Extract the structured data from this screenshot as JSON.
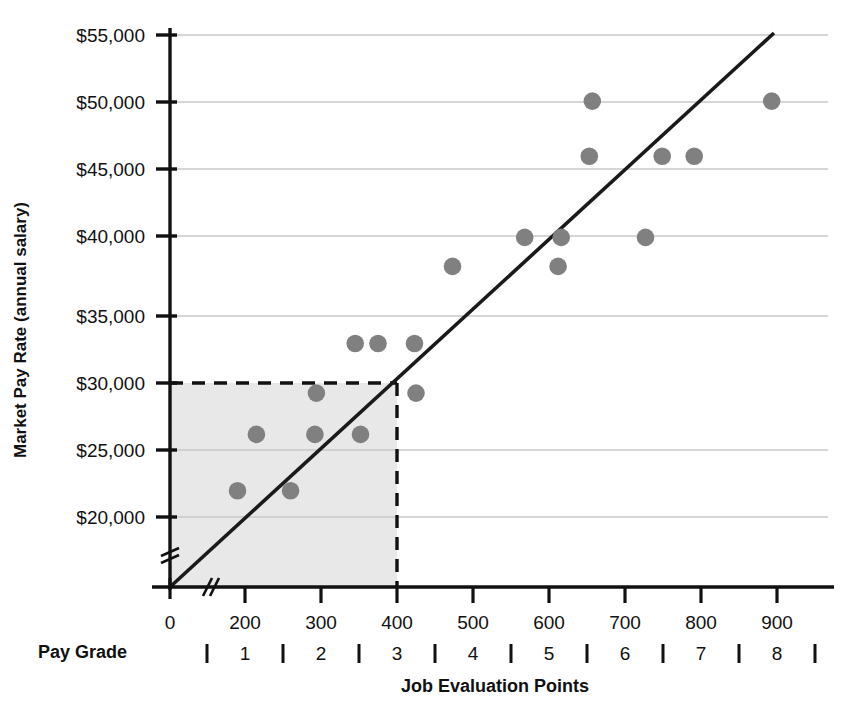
{
  "chart_data": {
    "type": "scatter",
    "title": "",
    "xlabel": "Job Evaluation Points",
    "ylabel": "Market Pay Rate (annual salary)",
    "secondary_axis_label": "Pay Grade",
    "xlim": [
      0,
      950
    ],
    "ylim": [
      17500,
      57500
    ],
    "x_ticks": [
      0,
      200,
      300,
      400,
      500,
      600,
      700,
      800,
      900
    ],
    "x_tick_labels": [
      "0",
      "200",
      "300",
      "400",
      "500",
      "600",
      "700",
      "800",
      "900"
    ],
    "y_ticks": [
      20000,
      25000,
      30000,
      35000,
      40000,
      45000,
      50000,
      55000
    ],
    "y_tick_labels": [
      "$20,000",
      "$25,000",
      "$30,000",
      "$35,000",
      "$40,000",
      "$45,000",
      "$50,000",
      "$55,000"
    ],
    "axis_break_x": true,
    "axis_break_y": true,
    "grid": "horizontal",
    "legend": "none",
    "point_color": "#808080",
    "line_color": "#1a1a1a",
    "shaded_region_color": "#e8e8e8",
    "pay_grades": [
      "1",
      "2",
      "3",
      "4",
      "5",
      "6",
      "7",
      "8"
    ],
    "pay_grade_boundaries": [
      150,
      250,
      350,
      450,
      550,
      650,
      750,
      850,
      950
    ],
    "points": [
      {
        "x": 180,
        "y": 21900
      },
      {
        "x": 260,
        "y": 21900
      },
      {
        "x": 215,
        "y": 26000
      },
      {
        "x": 292,
        "y": 26000
      },
      {
        "x": 352,
        "y": 26000
      },
      {
        "x": 294,
        "y": 29000
      },
      {
        "x": 425,
        "y": 29000
      },
      {
        "x": 345,
        "y": 32600
      },
      {
        "x": 375,
        "y": 32600
      },
      {
        "x": 423,
        "y": 32600
      },
      {
        "x": 473,
        "y": 38200
      },
      {
        "x": 612,
        "y": 38200
      },
      {
        "x": 568,
        "y": 40300
      },
      {
        "x": 616,
        "y": 40300
      },
      {
        "x": 727,
        "y": 40300
      },
      {
        "x": 653,
        "y": 46200
      },
      {
        "x": 749,
        "y": 46200
      },
      {
        "x": 791,
        "y": 46200
      },
      {
        "x": 657,
        "y": 50200
      },
      {
        "x": 893,
        "y": 50200
      }
    ],
    "trend_line": {
      "x1": 75,
      "y1": 17500,
      "x2": 893,
      "y2": 56200
    },
    "reference_lines": {
      "horizontal_value": 30000,
      "vertical_value": 400,
      "style": "dashed"
    },
    "shaded_region": {
      "x_from": 0,
      "x_to": 400,
      "y_from": 17500,
      "y_to": 30000
    }
  }
}
